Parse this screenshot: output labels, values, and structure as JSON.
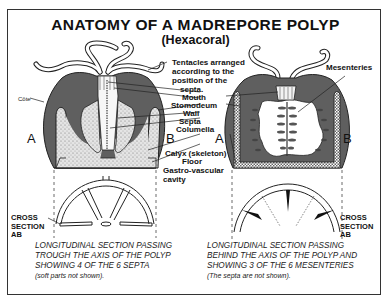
{
  "title": {
    "main": "ANATOMY OF A MADREPORE POLYP",
    "sub": "(Hexacoral)"
  },
  "labels": {
    "tentacles": [
      "Tentacles arranged",
      "according to the",
      "position of the",
      "septa."
    ],
    "mouth": "Mouth",
    "stomodeum": "Stomodeum",
    "wall": "Wall",
    "septa": "Septa",
    "columella": "Columella",
    "calyx": "Calyx (skeleton)",
    "floor": "Floor",
    "gastro": [
      "Gastro-vascular",
      "cavity"
    ],
    "mesenteries": "Mesenteries",
    "cote": "Côte"
  },
  "axis_markers": {
    "left_a": "A",
    "left_b": "B",
    "right_a": "A",
    "right_b": "B"
  },
  "cross_section": {
    "left": [
      "CROSS",
      "SECTION",
      "AB"
    ],
    "right": [
      "CROSS",
      "SECTION",
      "AB"
    ]
  },
  "captions": {
    "left": {
      "lines": [
        "LONGITUDINAL SECTION PASSING",
        "TROUGH THE AXIS OF THE POLYP",
        "SHOWING 4 OF THE 6 SEPTA"
      ],
      "note": "(soft parts not shown)."
    },
    "right": {
      "lines": [
        "LONGITUDINAL SECTION PASSING",
        "BEHIND THE AXIS OF THE POLYP AND",
        "SHOWING 3 OF THE 6 MESENTERIES"
      ],
      "note": "(The septa are not shown)."
    }
  },
  "colors": {
    "tissue": "#5f5f5f",
    "skeleton": "#d8d8d8",
    "line": "#222222",
    "background": "#ffffff"
  }
}
